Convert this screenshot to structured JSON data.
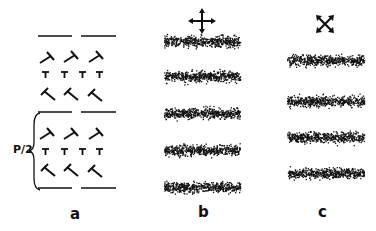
{
  "figure": {
    "panels": [
      {
        "id": "a",
        "label": "a",
        "content": "dislocation-array",
        "annotation": "P/2"
      },
      {
        "id": "b",
        "label": "b",
        "content": "stippled-bands",
        "band_count": 5,
        "icon": "crossed-arrows-icon"
      },
      {
        "id": "c",
        "label": "c",
        "content": "stippled-bands",
        "band_count": 4,
        "icon": "diagonal-crossed-arrows-icon"
      }
    ],
    "colors": {
      "ink": "#111111",
      "background": "#ffffff"
    }
  }
}
